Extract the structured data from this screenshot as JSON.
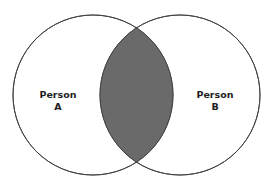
{
  "diagram": {
    "type": "venn",
    "sets": [
      {
        "id": "A",
        "line1": "Person",
        "line2": "A"
      },
      {
        "id": "B",
        "line1": "Person",
        "line2": "B"
      }
    ],
    "intersection": {
      "sets": [
        "A",
        "B"
      ],
      "shaded": true
    },
    "colors": {
      "background": "#ffffff",
      "outline": "#3c3c3c",
      "intersection_fill": "#6a6a6a",
      "text": "#1e1e1e"
    }
  }
}
